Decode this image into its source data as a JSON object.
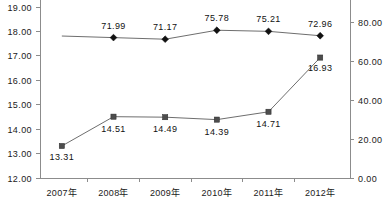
{
  "chart_data": {
    "type": "line",
    "title": "",
    "xlabel": "",
    "ylabel": "",
    "grid": false,
    "legend_position": "none",
    "categories": [
      "2007年",
      "2008年",
      "2009年",
      "2010年",
      "2011年",
      "2012年"
    ],
    "axes": {
      "left": {
        "ylim": [
          12.0,
          19.0
        ],
        "step": 1.0,
        "ticks": [
          "12.00",
          "13.00",
          "14.00",
          "15.00",
          "16.00",
          "17.00",
          "18.00",
          "19.00"
        ],
        "tick_values": [
          12.0,
          13.0,
          14.0,
          15.0,
          16.0,
          17.0,
          18.0,
          19.0
        ]
      },
      "right": {
        "ylim": [
          0.0,
          80.0
        ],
        "step": 20.0,
        "ticks": [
          "0.00",
          "20.00",
          "40.00",
          "60.00",
          "80.00"
        ],
        "tick_values": [
          0.0,
          20.0,
          40.0,
          60.0,
          80.0
        ]
      }
    },
    "series": [
      {
        "name": "diamond-series",
        "axis": "right",
        "marker": "diamond",
        "color": "#111111",
        "clipped_first_point": true,
        "values": [
          null,
          71.99,
          71.17,
          75.78,
          75.21,
          72.96
        ],
        "labels": [
          "",
          "71.99",
          "71.17",
          "75.78",
          "75.21",
          "72.96"
        ]
      },
      {
        "name": "square-series",
        "axis": "left",
        "marker": "square",
        "color": "#4d4d4d",
        "clipped_first_point": false,
        "values": [
          13.31,
          14.51,
          14.49,
          14.39,
          14.71,
          16.93
        ],
        "labels": [
          "13.31",
          "14.51",
          "14.49",
          "14.39",
          "14.71",
          "16.93"
        ]
      }
    ]
  },
  "colors": {
    "background": "#ffffff",
    "axis": "#8c8c8c",
    "line": "#6e6e6e",
    "text": "#111111"
  }
}
